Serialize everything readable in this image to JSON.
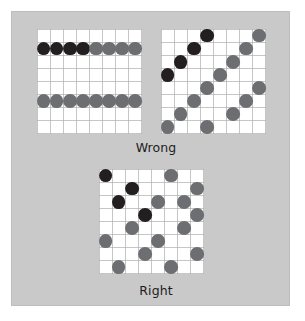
{
  "figure": {
    "background_color": "#ffffff",
    "panel_color": "#c9c9c9",
    "panel_border_color": "#bdbdbd",
    "grid_background_color": "#ffffff",
    "grid_line_color": "#aeaeae",
    "dot_color_dark": "#231f20",
    "dot_color_gray": "#6d6e71",
    "caption_color": "#1c1c1c"
  },
  "captions": {
    "wrong": "Wrong",
    "right": "Right"
  },
  "chart_data": {
    "type": "scatter",
    "title": "",
    "xlabel": "",
    "ylabel": "",
    "grid_size": {
      "cols": 8,
      "rows": 8
    },
    "legend": [
      {
        "name": "dark-points",
        "color": "#231f20"
      },
      {
        "name": "gray-points",
        "color": "#6d6e71"
      }
    ],
    "panels": [
      {
        "id": "wrong-left",
        "label": "Wrong",
        "note": "Two fully populated horizontal rows — all samples collapse onto two lines.",
        "series": [
          {
            "name": "dark-points",
            "color": "#231f20",
            "points": [
              {
                "col": 0,
                "row": 1
              },
              {
                "col": 1,
                "row": 1
              },
              {
                "col": 2,
                "row": 1
              },
              {
                "col": 3,
                "row": 1
              }
            ]
          },
          {
            "name": "gray-points",
            "color": "#6d6e71",
            "points": [
              {
                "col": 4,
                "row": 1
              },
              {
                "col": 5,
                "row": 1
              },
              {
                "col": 6,
                "row": 1
              },
              {
                "col": 7,
                "row": 1
              },
              {
                "col": 0,
                "row": 5
              },
              {
                "col": 1,
                "row": 5
              },
              {
                "col": 2,
                "row": 5
              },
              {
                "col": 3,
                "row": 5
              },
              {
                "col": 4,
                "row": 5
              },
              {
                "col": 5,
                "row": 5
              },
              {
                "col": 6,
                "row": 5
              },
              {
                "col": 7,
                "row": 5
              }
            ]
          }
        ]
      },
      {
        "id": "wrong-right",
        "label": "Wrong",
        "note": "Samples fall along two parallel diagonal lines — correlated, not well distributed.",
        "series": [
          {
            "name": "dark-points",
            "color": "#231f20",
            "points": [
              {
                "col": 3,
                "row": 0
              },
              {
                "col": 2,
                "row": 1
              },
              {
                "col": 1,
                "row": 2
              },
              {
                "col": 0,
                "row": 3
              }
            ]
          },
          {
            "name": "gray-points",
            "color": "#6d6e71",
            "points": [
              {
                "col": 7,
                "row": 0
              },
              {
                "col": 6,
                "row": 1
              },
              {
                "col": 5,
                "row": 2
              },
              {
                "col": 4,
                "row": 3
              },
              {
                "col": 3,
                "row": 4
              },
              {
                "col": 2,
                "row": 5
              },
              {
                "col": 1,
                "row": 6
              },
              {
                "col": 0,
                "row": 7
              },
              {
                "col": 7,
                "row": 4
              },
              {
                "col": 6,
                "row": 5
              },
              {
                "col": 5,
                "row": 6
              },
              {
                "col": 3,
                "row": 7
              }
            ]
          }
        ]
      },
      {
        "id": "right-bottom",
        "label": "Right",
        "note": "Well stratified sample set — one sample per row and per column, scattered.",
        "series": [
          {
            "name": "dark-points",
            "color": "#231f20",
            "points": [
              {
                "col": 0,
                "row": 0
              },
              {
                "col": 2,
                "row": 1
              },
              {
                "col": 1,
                "row": 2
              },
              {
                "col": 3,
                "row": 3
              }
            ]
          },
          {
            "name": "gray-points",
            "color": "#6d6e71",
            "points": [
              {
                "col": 5,
                "row": 0
              },
              {
                "col": 7,
                "row": 1
              },
              {
                "col": 6,
                "row": 2
              },
              {
                "col": 4,
                "row": 2
              },
              {
                "col": 2,
                "row": 4
              },
              {
                "col": 7,
                "row": 3
              },
              {
                "col": 6,
                "row": 4
              },
              {
                "col": 0,
                "row": 5
              },
              {
                "col": 4,
                "row": 5
              },
              {
                "col": 3,
                "row": 6
              },
              {
                "col": 7,
                "row": 6
              },
              {
                "col": 1,
                "row": 7
              },
              {
                "col": 5,
                "row": 7
              }
            ]
          }
        ]
      }
    ]
  },
  "layout": {
    "grids": [
      {
        "id": "wrong-left",
        "left": 36,
        "top": 28,
        "size": 105
      },
      {
        "id": "wrong-right",
        "left": 160,
        "top": 28,
        "size": 105
      },
      {
        "id": "right-bottom",
        "left": 98,
        "top": 168,
        "size": 105
      }
    ],
    "captions": [
      {
        "id": "wrong",
        "left": 100,
        "top": 140,
        "width": 110
      },
      {
        "id": "right",
        "left": 100,
        "top": 283,
        "width": 110
      }
    ],
    "dot_diameter": 13.8
  }
}
